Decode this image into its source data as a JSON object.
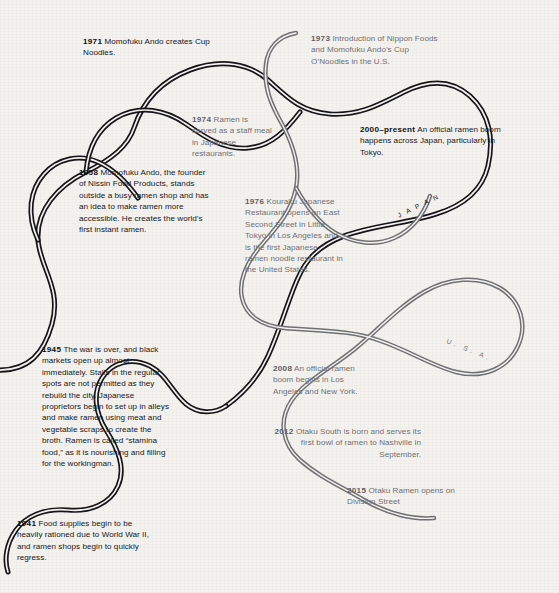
{
  "meta": {
    "background_color": "#f4f2ef",
    "japan_strand_color": "#16161a",
    "usa_strand_color": "#6f7074"
  },
  "path_labels": {
    "japan": "J A P A N",
    "usa": "U. S. A."
  },
  "entries": [
    {
      "id": "1971",
      "year": "1971",
      "strand": "japan",
      "text": "Momofuku Ando creates Cup Noodles."
    },
    {
      "id": "1973",
      "year": "1973",
      "strand": "usa",
      "text": "Introduction of Nippon Foods and Momofuku Ando’s Cup O’Noodles in the U.S."
    },
    {
      "id": "1974",
      "year": "1974",
      "strand": "usa",
      "text": "Ramen is served as a staff meal in Japanese restaurants."
    },
    {
      "id": "2000-present",
      "year": "2000–present",
      "strand": "japan",
      "text": "An official ramen boom happens across Japan, particularly in Tokyo."
    },
    {
      "id": "1958",
      "year": "1958",
      "strand": "japan",
      "text": "Momofuku Ando, the founder of Nissin Food Products, stands outside a busy ramen shop and has an idea to make ramen more accessible. He creates the world’s first instant ramen."
    },
    {
      "id": "1976",
      "year": "1976",
      "strand": "usa",
      "text": "Kouraku Japanese Restaurant opens on East Second Street in Little Tokyo in Los Angeles and is the first Japanese ramen noodle restaurant in the United States."
    },
    {
      "id": "1945",
      "year": "1945",
      "strand": "japan",
      "text": "The war is over, and black markets open up almost immediately. Stalls in the regular spots are not permitted as they rebuild the city. Japanese proprietors begin to set up in alleys and make ramen using meat and vegetable scraps to create the broth. Ramen is called “stamina food,” as it is nourishing and filling for the workingman."
    },
    {
      "id": "2008",
      "year": "2008",
      "strand": "usa",
      "text": "An official ramen boom begins in Los Angeles and New York."
    },
    {
      "id": "2012",
      "year": "2012",
      "strand": "usa",
      "text": "Otaku South is born and serves its first bowl of ramen to Nashville in September."
    },
    {
      "id": "2015",
      "year": "2015",
      "strand": "usa",
      "text": "Otaku Ramen opens on Division Street"
    },
    {
      "id": "1941",
      "year": "1941",
      "strand": "japan",
      "text": "Food supplies begin to be heavily rationed due to World War II, and ramen shops begin to quickly regress."
    }
  ]
}
